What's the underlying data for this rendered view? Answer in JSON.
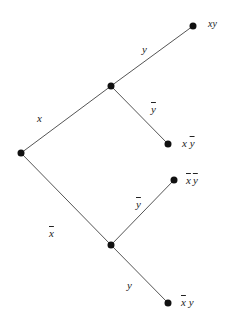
{
  "diagram": {
    "type": "tree",
    "nodes": [
      {
        "id": "root",
        "x": 21,
        "y": 153
      },
      {
        "id": "x",
        "x": 111,
        "y": 86
      },
      {
        "id": "xbar",
        "x": 111,
        "y": 245
      },
      {
        "id": "xy",
        "x": 193,
        "y": 26
      },
      {
        "id": "x_ybar",
        "x": 168,
        "y": 144
      },
      {
        "id": "xbar_ybar",
        "x": 174,
        "y": 180
      },
      {
        "id": "xbar_y",
        "x": 168,
        "y": 303
      }
    ],
    "edges": [
      {
        "from": "root",
        "to": "x",
        "label": "x"
      },
      {
        "from": "root",
        "to": "xbar",
        "label": "x̄"
      },
      {
        "from": "x",
        "to": "xy",
        "label": "y"
      },
      {
        "from": "x",
        "to": "x_ybar",
        "label": "ȳ"
      },
      {
        "from": "xbar",
        "to": "xbar_ybar",
        "label": "ȳ"
      },
      {
        "from": "xbar",
        "to": "xbar_y",
        "label": "y"
      }
    ],
    "edge_labels": {
      "x": "x",
      "xbar": "x",
      "upper_y": "y",
      "upper_ybar": "y",
      "lower_ybar": "y",
      "lower_y": "y"
    },
    "leaf_labels": {
      "xy": "xy",
      "x_ybar_x": "x",
      "x_ybar_y": "y",
      "xbar_ybar_x": "x",
      "xbar_ybar_y": "y",
      "xbar_y_x": "x",
      "xbar_y_y": "y"
    },
    "colors": {
      "line": "#555555",
      "node": "#111111",
      "text": "#222222"
    }
  }
}
